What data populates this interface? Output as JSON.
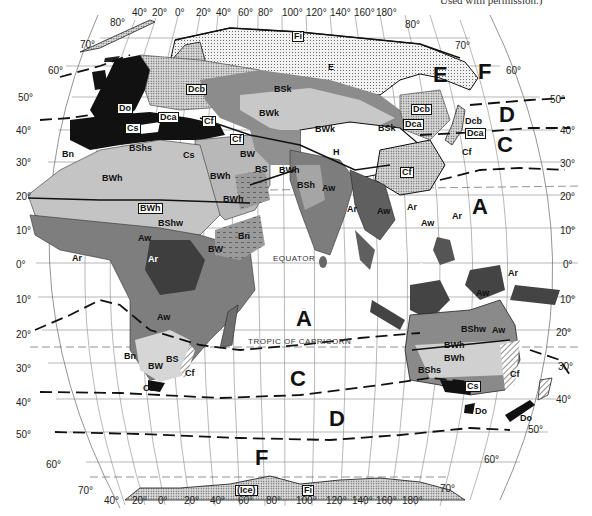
{
  "caption": "Used with permission.)",
  "map": {
    "title": "Climate classification map of the Eastern Hemisphere",
    "reference_lines": {
      "equator": "EQUATOR",
      "tropic": "TROPIC OF CAPRICORN"
    },
    "top_longitudes": [
      "40°",
      "20°",
      "0°",
      "20°",
      "40°",
      "60°",
      "80°",
      "100°",
      "120°",
      "140°",
      "160°",
      "180°"
    ],
    "bottom_longitudes": [
      "40°",
      "20°",
      "0°",
      "20°",
      "40°",
      "60°",
      "80°",
      "100°",
      "120°",
      "140°",
      "160°",
      "180°"
    ],
    "left_latitudes": [
      "80°",
      "70°",
      "60°",
      "50°",
      "40°",
      "30°",
      "20°",
      "10°",
      "0°",
      "10°",
      "20°",
      "30°",
      "40°",
      "50°",
      "60°",
      "70°"
    ],
    "right_latitudes": [
      "80°",
      "70°",
      "60°",
      "50°",
      "40°",
      "30°",
      "20°",
      "10°",
      "0°",
      "10°",
      "20°",
      "30°",
      "40°",
      "50°",
      "60°",
      "70°"
    ],
    "zone_letters": {
      "A_north": "A",
      "A_south": "A",
      "C_north": "C",
      "C_south": "C",
      "D_north": "D",
      "D_south": "D",
      "E_north": "E",
      "F_north": "F",
      "F_south": "F"
    },
    "region_labels": {
      "greenland_fi": "Fi",
      "siberia_e": "E",
      "europe_do": "Do",
      "europe_dcb": "Dcb",
      "europe_dca": "Dca",
      "europe_cs": "Cs",
      "blacksea_cf": "Cf",
      "turkey_cf": "Cf",
      "asia_bsk_w": "BSk",
      "asia_bwk_w": "BWk",
      "asia_bwk_e": "BWk",
      "asia_bsk_e": "BSk",
      "tibet_h": "H",
      "china_dcb": "Dcb",
      "china_dca": "Dca",
      "china_cf": "Cf",
      "japan_dcb": "Dcb",
      "japan_dca": "Dca",
      "japan_cf": "Cf",
      "morocco_bn": "Bn",
      "nafrica_bshs": "BShs",
      "sahara_bwh": "BWh",
      "sahel_bwh": "BWh",
      "sahel_bshw": "BShw",
      "levant_cs": "Cs",
      "iran_bw": "BW",
      "iran_bs": "BS",
      "pakistan_bwh": "BWh",
      "arabia_bwh_n": "BWh",
      "arabia_bwh_s": "BWh",
      "india_bsh": "BSh",
      "india_aw": "Aw",
      "horn_bn": "Bn",
      "horn_bw": "BW",
      "wafrica_ar": "Ar",
      "congo_ar": "Ar",
      "eafrica_aw": "Aw",
      "safrica_aw": "Aw",
      "namibia_bn": "Bn",
      "namibia_bw": "BW",
      "safrica_bs": "BS",
      "safrica_cf": "Cf",
      "cape_cs": "Cs",
      "burma_ar": "Ar",
      "indochina_aw": "Aw",
      "vietnam_ar": "Ar",
      "phil_aw": "Aw",
      "phil_ar": "Ar",
      "borneo_ar": "Ar",
      "newguinea_ar": "Ar",
      "timor_aw": "Aw",
      "aus_bshw": "BShw",
      "aus_aw": "Aw",
      "aus_bwh_n": "BWh",
      "aus_bwh_s": "BWh",
      "aus_bshs": "BShs",
      "aus_cs": "Cs",
      "aus_cf": "Cf",
      "tasmania_do": "Do",
      "nz_do": "Do",
      "antarctica_ice": "(Ice)",
      "antarctica_fi": "Fi"
    }
  }
}
